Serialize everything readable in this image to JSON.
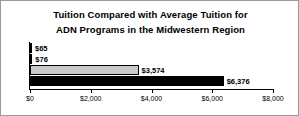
{
  "chart_data": {
    "type": "bar",
    "orientation": "horizontal",
    "title": "Tuition Compared with Average Tuition for ADN Programs in the Midwestern Region",
    "title_lines": [
      "Tuition Compared with Average Tuition for",
      "ADN Programs in the Midwestern Region"
    ],
    "xlabel": "",
    "ylabel": "",
    "xlim": [
      0,
      8000
    ],
    "grid": false,
    "legend": "none",
    "tick_labels": [
      "$0",
      "$2,000",
      "$4,000",
      "$6,000",
      "$8,000"
    ],
    "tick_values": [
      0,
      2000,
      4000,
      6000,
      8000
    ],
    "categories": [
      "",
      "",
      "",
      ""
    ],
    "values": [
      65,
      76,
      3574,
      6376
    ],
    "bars": [
      {
        "value": 65,
        "label": "$65",
        "color": "#000000",
        "style": "dark"
      },
      {
        "value": 76,
        "label": "$76",
        "color": "#000000",
        "style": "dark"
      },
      {
        "value": 3574,
        "label": "$3,574",
        "color": "#c9c9c9",
        "style": "gray"
      },
      {
        "value": 6376,
        "label": "$6,376",
        "color": "#000000",
        "style": "dark"
      }
    ]
  },
  "colors": {
    "bar_dark": "#000000",
    "bar_gray": "#c9c9c9",
    "axis": "#000000",
    "frame": "#9a9a9a",
    "background": "#ffffff"
  }
}
